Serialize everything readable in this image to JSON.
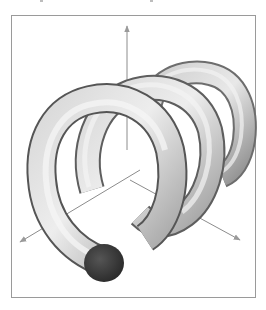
{
  "figure": {
    "coils": 3,
    "axes": [
      "vertical-axis",
      "left-diagonal-axis",
      "right-diagonal-axis"
    ],
    "colors": {
      "background": "#ffffff",
      "frame_border": "#9a9a9a",
      "tube_light": "#e6e6e6",
      "tube_mid": "#b5b5b5",
      "tube_dark": "#5a5a5a",
      "end_cap": "#3a3a3a",
      "axis": "#8c8c8c"
    }
  }
}
